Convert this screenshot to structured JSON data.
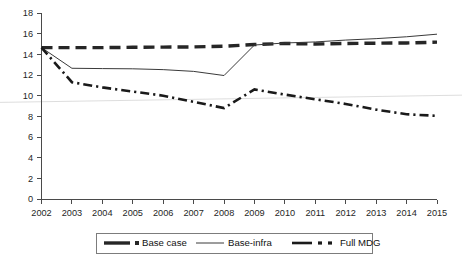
{
  "chart_data": {
    "type": "line",
    "title": "",
    "xlabel": "",
    "ylabel": "",
    "categories": [
      "2002",
      "2003",
      "2004",
      "2005",
      "2006",
      "2007",
      "2008",
      "2009",
      "2010",
      "2011",
      "2012",
      "2013",
      "2014",
      "2015"
    ],
    "x": [
      2002,
      2003,
      2004,
      2005,
      2006,
      2007,
      2008,
      2009,
      2010,
      2011,
      2012,
      2013,
      2014,
      2015
    ],
    "xlim": [
      2002,
      2015
    ],
    "ylim": [
      0,
      18
    ],
    "ytick_labels": [
      "0",
      "2",
      "4",
      "6",
      "8",
      "10",
      "12",
      "14",
      "16",
      "18"
    ],
    "ytick_values": [
      0,
      2,
      4,
      6,
      8,
      10,
      12,
      14,
      16,
      18
    ],
    "grid": "single faint horizontal line near 9.5",
    "legend_position": "bottom-center",
    "series": [
      {
        "name": "Base case",
        "style": "thick-dashed",
        "color": "#262626",
        "values": [
          14.65,
          14.65,
          14.65,
          14.68,
          14.7,
          14.72,
          14.78,
          14.95,
          15.05,
          15.0,
          15.05,
          15.08,
          15.1,
          15.18
        ]
      },
      {
        "name": "Base-infra",
        "style": "thin-solid",
        "color": "#3a3a3a",
        "values": [
          14.65,
          12.65,
          12.62,
          12.6,
          12.52,
          12.35,
          11.95,
          14.9,
          15.1,
          15.2,
          15.38,
          15.52,
          15.7,
          15.95
        ]
      },
      {
        "name": "Full MDG",
        "style": "dash-dot",
        "color": "#1a1a1a",
        "values": [
          14.65,
          11.3,
          10.8,
          10.4,
          10.0,
          9.4,
          8.8,
          10.6,
          10.1,
          9.65,
          9.2,
          8.65,
          8.2,
          8.05
        ]
      }
    ]
  },
  "legend": {
    "items": [
      {
        "label": "Base case"
      },
      {
        "label": "Base-infra"
      },
      {
        "label": "Full MDG"
      }
    ]
  }
}
